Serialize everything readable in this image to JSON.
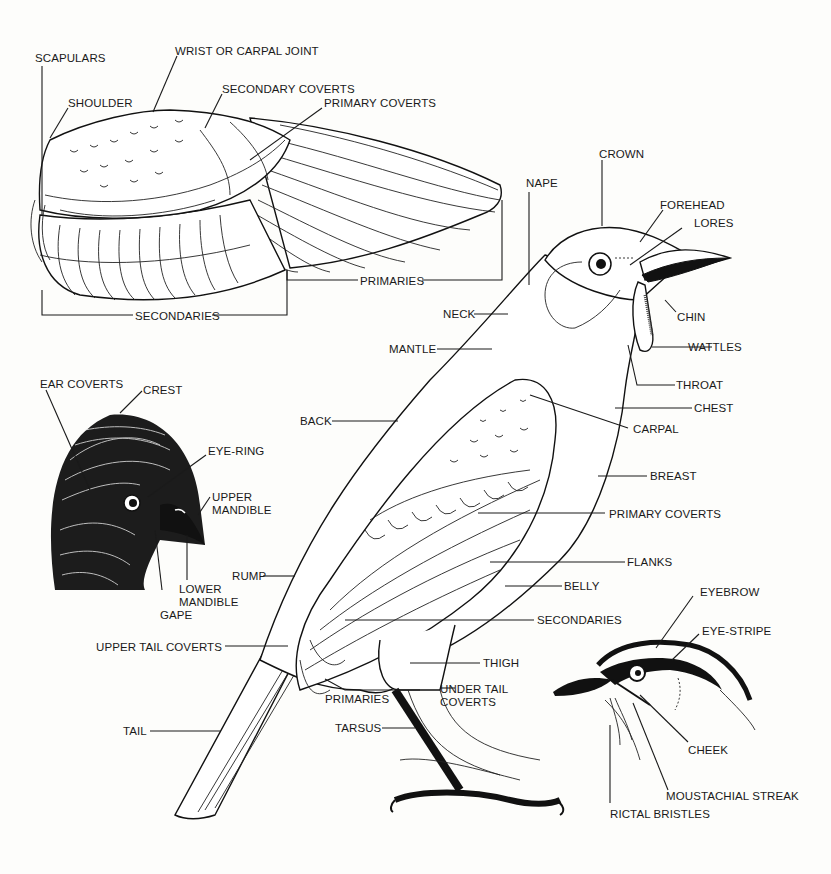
{
  "diagram": {
    "colors": {
      "ink": "#1a1a1a",
      "paper": "#fdfdfb"
    },
    "wing": {
      "labels": {
        "scapulars": "SCAPULARS",
        "wrist": "WRIST OR CARPAL JOINT",
        "shoulder": "SHOULDER",
        "secondary_coverts": "SECONDARY COVERTS",
        "primary_coverts": "PRIMARY COVERTS",
        "primaries": "PRIMARIES",
        "secondaries": "SECONDARIES"
      }
    },
    "main_bird": {
      "labels": {
        "crown": "CROWN",
        "nape": "NAPE",
        "forehead": "FOREHEAD",
        "lores": "LORES",
        "chin": "CHIN",
        "neck": "NECK",
        "wattles": "WATTLES",
        "mantle": "MANTLE",
        "throat": "THROAT",
        "chest": "CHEST",
        "back": "BACK",
        "carpal": "CARPAL",
        "breast": "BREAST",
        "primary_coverts": "PRIMARY COVERTS",
        "flanks": "FLANKS",
        "rump": "RUMP",
        "belly": "BELLY",
        "secondaries": "SECONDARIES",
        "upper_tail_coverts": "UPPER TAIL COVERTS",
        "thigh": "THIGH",
        "primaries": "PRIMARIES",
        "under_tail_coverts_1": "UNDER TAIL",
        "under_tail_coverts_2": "COVERTS",
        "tarsus": "TARSUS",
        "tail": "TAIL"
      }
    },
    "crested_head": {
      "labels": {
        "ear_coverts": "EAR COVERTS",
        "crest": "CREST",
        "eye_ring": "EYE-RING",
        "upper_mandible_1": "UPPER",
        "upper_mandible_2": "MANDIBLE",
        "lower_mandible_1": "LOWER",
        "lower_mandible_2": "MANDIBLE",
        "gape": "GAPE"
      }
    },
    "striped_head": {
      "labels": {
        "eyebrow": "EYEBROW",
        "eye_stripe": "EYE-STRIPE",
        "cheek": "CHEEK",
        "moustachial_streak": "MOUSTACHIAL STREAK",
        "rictal_bristles": "RICTAL BRISTLES"
      }
    }
  }
}
